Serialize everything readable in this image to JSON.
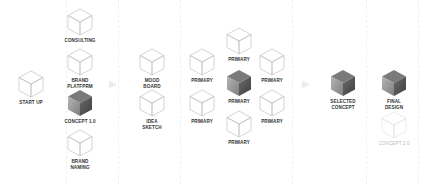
{
  "diagram": {
    "title": "",
    "colors": {
      "outline": "#b8b8b8",
      "dark_top": "#7a7a7a",
      "dark_left": "#999999",
      "dark_right": "#555555",
      "faint": "#e0e0e0",
      "label": "#333333"
    },
    "stages": [
      {
        "id": "stage-1",
        "nodes": [
          {
            "label": "START UP",
            "style": "outline",
            "x": 31,
            "y": 70
          }
        ]
      },
      {
        "id": "stage-2",
        "nodes": [
          {
            "label": "CONSULTING",
            "style": "outline",
            "x": 80,
            "y": 8
          },
          {
            "label": "BRAND\nPLATFPRM",
            "style": "outline",
            "x": 80,
            "y": 48
          },
          {
            "label": "CONCEPT 1.0",
            "style": "dark",
            "x": 80,
            "y": 89
          },
          {
            "label": "BRAND\nNAMING",
            "style": "outline",
            "x": 80,
            "y": 129
          }
        ]
      },
      {
        "id": "stage-3",
        "nodes": [
          {
            "label": "MOOD\nBOARD",
            "style": "outline",
            "x": 152,
            "y": 48
          },
          {
            "label": "IDEA\nSKETCH",
            "style": "outline",
            "x": 152,
            "y": 89
          }
        ]
      },
      {
        "id": "stage-4",
        "nodes": [
          {
            "label": "PRIMARY",
            "style": "outline",
            "x": 202,
            "y": 48
          },
          {
            "label": "PRIMARY",
            "style": "outline",
            "x": 202,
            "y": 89
          },
          {
            "label": "PRIMARY",
            "style": "outline",
            "x": 239,
            "y": 27
          },
          {
            "label": "PRIMARY",
            "style": "dark",
            "x": 239,
            "y": 69
          },
          {
            "label": "PRIMARY",
            "style": "outline",
            "x": 239,
            "y": 110
          },
          {
            "label": "PRIMARY",
            "style": "outline",
            "x": 272,
            "y": 48
          },
          {
            "label": "PRIMARY",
            "style": "outline",
            "x": 272,
            "y": 89
          }
        ]
      },
      {
        "id": "stage-5",
        "nodes": [
          {
            "label": "SELECTED\nCONCEPT",
            "style": "dark",
            "x": 343,
            "y": 69
          }
        ]
      },
      {
        "id": "stage-6",
        "nodes": [
          {
            "label": "FINAL\nDESIGN",
            "style": "dark",
            "x": 394,
            "y": 69
          },
          {
            "label": "CONCEPT 2.0",
            "style": "faint",
            "x": 394,
            "y": 111
          }
        ]
      }
    ],
    "arrows": [
      {
        "x": 113,
        "y": 84,
        "glyph": "▶"
      },
      {
        "x": 306,
        "y": 84,
        "glyph": "▶"
      }
    ],
    "separators": [
      66,
      118,
      180,
      292,
      366,
      418
    ]
  }
}
